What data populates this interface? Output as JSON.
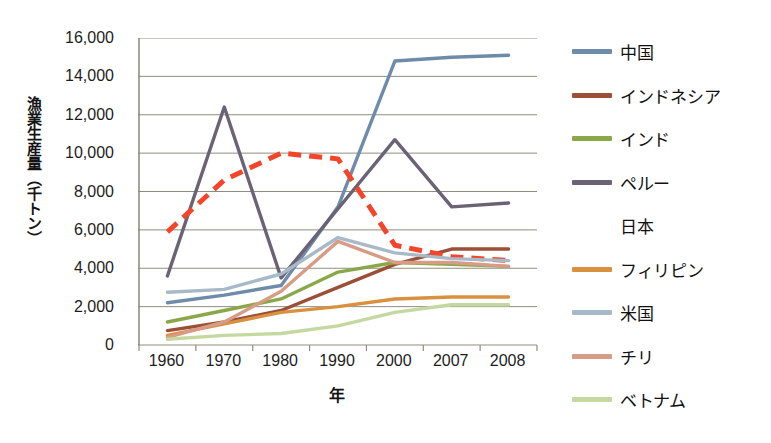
{
  "chart_data": {
    "type": "line",
    "title": "",
    "xlabel": "年",
    "ylabel": "漁業生産量（千トン）",
    "categories": [
      "1960",
      "1970",
      "1980",
      "1990",
      "2000",
      "2007",
      "2008"
    ],
    "ylim": [
      0,
      16000
    ],
    "ytick_labels": [
      "0",
      "2,000",
      "4,000",
      "6,000",
      "8,000",
      "10,000",
      "12,000",
      "14,000",
      "16,000"
    ],
    "ytick_values": [
      0,
      2000,
      4000,
      6000,
      8000,
      10000,
      12000,
      14000,
      16000
    ],
    "grid": true,
    "legend_position": "right",
    "series": [
      {
        "name": "中国",
        "color": "#6e8caa",
        "style": "solid",
        "values": [
          2200,
          2600,
          3100,
          7200,
          14800,
          15000,
          15100
        ]
      },
      {
        "name": "インドネシア",
        "color": "#9b4f37",
        "style": "solid",
        "values": [
          750,
          1200,
          1800,
          3000,
          4200,
          5000,
          5000
        ]
      },
      {
        "name": "インド",
        "color": "#8aa84a",
        "style": "solid",
        "values": [
          1200,
          1800,
          2400,
          3800,
          4300,
          4200,
          4100
        ]
      },
      {
        "name": "ペルー",
        "color": "#6b6275",
        "style": "solid",
        "values": [
          3600,
          12400,
          3500,
          7100,
          10700,
          7200,
          7400
        ]
      },
      {
        "name": "日本",
        "color": "#f4452a",
        "style": "dashed",
        "values": [
          5900,
          8600,
          10000,
          9700,
          5200,
          4600,
          4400
        ]
      },
      {
        "name": "フィリピン",
        "color": "#d9913f",
        "style": "solid",
        "values": [
          500,
          1100,
          1700,
          2000,
          2400,
          2500,
          2500
        ]
      },
      {
        "name": "米国",
        "color": "#a8b9c7",
        "style": "solid",
        "values": [
          2750,
          2900,
          3700,
          5600,
          4800,
          4500,
          4400
        ]
      },
      {
        "name": "チリ",
        "color": "#d79b86",
        "style": "solid",
        "values": [
          400,
          1200,
          2800,
          5400,
          4300,
          4300,
          4100
        ]
      },
      {
        "name": "ベトナム",
        "color": "#c3d9a0",
        "style": "solid",
        "values": [
          300,
          500,
          600,
          1000,
          1700,
          2100,
          2100
        ]
      }
    ]
  },
  "legend": {
    "items": [
      {
        "label": "中国"
      },
      {
        "label": "インドネシア"
      },
      {
        "label": "インド"
      },
      {
        "label": "ペルー"
      },
      {
        "label": "日本"
      },
      {
        "label": "フィリピン"
      },
      {
        "label": "米国"
      },
      {
        "label": "チリ"
      },
      {
        "label": "ベトナム"
      }
    ]
  }
}
